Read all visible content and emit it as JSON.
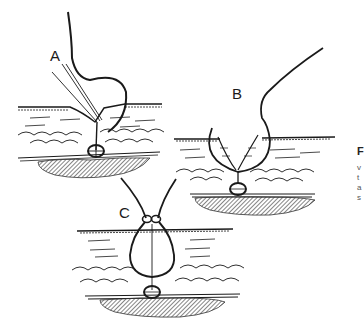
{
  "figure": {
    "panels": [
      {
        "label": "A",
        "description": "Needle inserted at angle through skin wedge; suture loops around deep tissue"
      },
      {
        "label": "B",
        "description": "Curved needle passes through both wound edges forming deep loop"
      },
      {
        "label": "C",
        "description": "Suture tied above closed wound, pear-shaped loop through tissue layers"
      }
    ],
    "caption_fragments": [
      "F",
      "v",
      "t",
      "a",
      "s"
    ],
    "colors": {
      "ink": "#1a1a1a",
      "hatch": "#333333",
      "background": "#ffffff"
    }
  }
}
